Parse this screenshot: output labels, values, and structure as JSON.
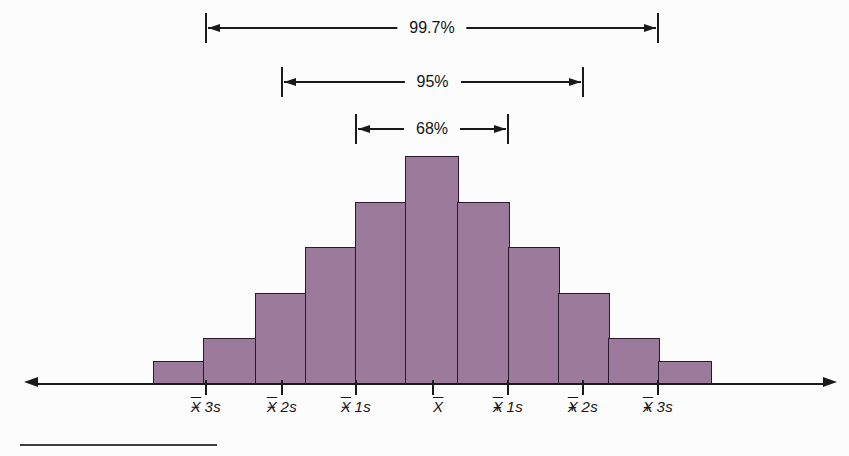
{
  "figure": {
    "kind": "textbook statistics figure"
  },
  "chart_data": {
    "type": "bar",
    "subtype": "histogram",
    "title": "",
    "xlabel": "",
    "ylabel": "",
    "grid": false,
    "legend": "none",
    "bar_fill_color": "#9c7a9c",
    "bar_border_color": "#2b1a2b",
    "bars": {
      "count": 11,
      "relative_heights": [
        1,
        2,
        4,
        6,
        8,
        10,
        8,
        6,
        4,
        2,
        1
      ]
    },
    "x_axis": {
      "arrowed_both_ends": true,
      "tick_labels": [
        "X̄ − 3s",
        "X̄ − 2s",
        "X̄ − 1s",
        "X̄",
        "X̄ + 1s",
        "X̄ + 2s",
        "X̄ + 3s"
      ]
    },
    "annotations": [
      {
        "label": "99.7%",
        "from_tick": 0,
        "to_tick": 6
      },
      {
        "label": "95%",
        "from_tick": 1,
        "to_tick": 5
      },
      {
        "label": "68%",
        "from_tick": 2,
        "to_tick": 4
      }
    ],
    "decorations": {
      "footnote_rule": true
    }
  }
}
